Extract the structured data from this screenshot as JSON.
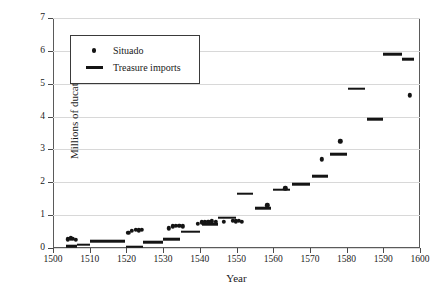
{
  "chart_data": {
    "type": "scatter",
    "title": "",
    "xlabel": "Year",
    "ylabel": "Millions of ducats",
    "xlim": [
      1500,
      1600
    ],
    "ylim": [
      0,
      7
    ],
    "xticks": [
      1500,
      1510,
      1520,
      1530,
      1540,
      1550,
      1560,
      1570,
      1580,
      1590,
      1600
    ],
    "yticks": [
      0,
      1,
      2,
      3,
      4,
      5,
      6,
      7
    ],
    "grid": "horizontal",
    "legend_position": "upper-left-inside",
    "series": [
      {
        "name": "Situado",
        "marker": "dot",
        "color": "#141414",
        "points": [
          [
            1504.0,
            0.26
          ],
          [
            1504.8,
            0.3
          ],
          [
            1505.4,
            0.28
          ],
          [
            1506.2,
            0.25
          ],
          [
            1520.5,
            0.46
          ],
          [
            1521.4,
            0.52
          ],
          [
            1522.6,
            0.55
          ],
          [
            1523.4,
            0.54
          ],
          [
            1524.2,
            0.56
          ],
          [
            1531.5,
            0.6
          ],
          [
            1532.6,
            0.66
          ],
          [
            1533.5,
            0.68
          ],
          [
            1534.4,
            0.67
          ],
          [
            1535.3,
            0.66
          ],
          [
            1539.5,
            0.74
          ],
          [
            1540.5,
            0.78
          ],
          [
            1541.4,
            0.79
          ],
          [
            1542.3,
            0.8
          ],
          [
            1543.2,
            0.81
          ],
          [
            1544.3,
            0.79
          ],
          [
            1546.5,
            0.8
          ],
          [
            1549.0,
            0.82
          ],
          [
            1549.8,
            0.81
          ],
          [
            1550.6,
            0.83
          ],
          [
            1551.5,
            0.8
          ],
          [
            1558.4,
            1.3
          ],
          [
            1563.3,
            1.82
          ],
          [
            1573.2,
            2.7
          ],
          [
            1578.3,
            3.25
          ],
          [
            1597.2,
            4.65
          ]
        ]
      },
      {
        "name": "Treasure imports",
        "marker": "hbar",
        "color": "#141414",
        "segments": [
          {
            "x_start": 1503.5,
            "x_end": 1506.5,
            "y": 0.06
          },
          {
            "x_start": 1506.5,
            "x_end": 1510.0,
            "y": 0.1
          },
          {
            "x_start": 1510.0,
            "x_end": 1515.0,
            "y": 0.2
          },
          {
            "x_start": 1515.0,
            "x_end": 1519.5,
            "y": 0.21
          },
          {
            "x_start": 1520.0,
            "x_end": 1524.5,
            "y": 0.04
          },
          {
            "x_start": 1524.5,
            "x_end": 1530.0,
            "y": 0.17
          },
          {
            "x_start": 1530.0,
            "x_end": 1534.5,
            "y": 0.26
          },
          {
            "x_start": 1535.0,
            "x_end": 1540.0,
            "y": 0.5
          },
          {
            "x_start": 1540.5,
            "x_end": 1545.0,
            "y": 0.72
          },
          {
            "x_start": 1545.0,
            "x_end": 1550.0,
            "y": 0.92
          },
          {
            "x_start": 1550.0,
            "x_end": 1554.5,
            "y": 1.65
          },
          {
            "x_start": 1555.0,
            "x_end": 1559.5,
            "y": 1.22
          },
          {
            "x_start": 1560.0,
            "x_end": 1564.5,
            "y": 1.78
          },
          {
            "x_start": 1565.0,
            "x_end": 1570.0,
            "y": 1.95
          },
          {
            "x_start": 1570.5,
            "x_end": 1575.0,
            "y": 2.18
          },
          {
            "x_start": 1575.5,
            "x_end": 1580.0,
            "y": 2.85
          },
          {
            "x_start": 1580.5,
            "x_end": 1585.0,
            "y": 4.85
          },
          {
            "x_start": 1585.5,
            "x_end": 1590.0,
            "y": 3.92
          },
          {
            "x_start": 1590.0,
            "x_end": 1595.0,
            "y": 5.9
          },
          {
            "x_start": 1595.0,
            "x_end": 1598.5,
            "y": 5.74
          }
        ]
      }
    ]
  },
  "legend": {
    "items": [
      {
        "label": "Situado",
        "key": "dot-marker"
      },
      {
        "label": "Treasure imports",
        "key": "line-marker"
      }
    ]
  },
  "axes": {
    "x_title": "Year",
    "y_title": "Millions of ducats",
    "x_tick_labels": [
      "1500",
      "1510",
      "1520",
      "1530",
      "1540",
      "1550",
      "1560",
      "1570",
      "1580",
      "1590",
      "1600"
    ],
    "y_tick_labels": [
      "0",
      "1",
      "2",
      "3",
      "4",
      "5",
      "6",
      "7"
    ]
  },
  "colors": {
    "mark": "#141414",
    "gridline": "#d8d8d8",
    "axis": "#5a5a5a",
    "background": "#ffffff"
  }
}
